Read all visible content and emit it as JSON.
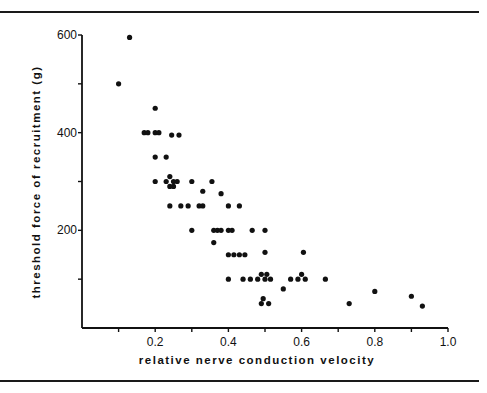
{
  "chart_data": {
    "type": "scatter",
    "title": "",
    "xlabel": "relative nerve conduction velocity",
    "ylabel": "threshold force of recruitment (g)",
    "xlim": [
      0,
      1.0
    ],
    "ylim": [
      0,
      600
    ],
    "x_ticks": [
      0.1,
      0.2,
      0.3,
      0.4,
      0.5,
      0.6,
      0.7,
      0.8,
      0.9,
      1.0
    ],
    "x_tick_labels": [
      "0.2",
      "0.4",
      "0.6",
      "0.8",
      "1.0"
    ],
    "x_labeled_tick_values": [
      0.2,
      0.4,
      0.6,
      0.8,
      1.0
    ],
    "y_ticks": [
      100,
      200,
      300,
      400,
      500,
      600
    ],
    "y_tick_labels": [
      "200",
      "400",
      "600"
    ],
    "y_labeled_tick_values": [
      200,
      400,
      600
    ],
    "grid": false,
    "legend": null,
    "points": [
      {
        "x": 0.1,
        "y": 500
      },
      {
        "x": 0.13,
        "y": 595
      },
      {
        "x": 0.2,
        "y": 450
      },
      {
        "x": 0.17,
        "y": 400
      },
      {
        "x": 0.18,
        "y": 400
      },
      {
        "x": 0.2,
        "y": 400
      },
      {
        "x": 0.21,
        "y": 400
      },
      {
        "x": 0.245,
        "y": 395
      },
      {
        "x": 0.265,
        "y": 395
      },
      {
        "x": 0.2,
        "y": 350
      },
      {
        "x": 0.23,
        "y": 350
      },
      {
        "x": 0.2,
        "y": 300
      },
      {
        "x": 0.23,
        "y": 300
      },
      {
        "x": 0.24,
        "y": 310
      },
      {
        "x": 0.25,
        "y": 300
      },
      {
        "x": 0.26,
        "y": 300
      },
      {
        "x": 0.24,
        "y": 290
      },
      {
        "x": 0.25,
        "y": 290
      },
      {
        "x": 0.3,
        "y": 300
      },
      {
        "x": 0.33,
        "y": 280
      },
      {
        "x": 0.355,
        "y": 300
      },
      {
        "x": 0.24,
        "y": 250
      },
      {
        "x": 0.27,
        "y": 250
      },
      {
        "x": 0.29,
        "y": 250
      },
      {
        "x": 0.32,
        "y": 250
      },
      {
        "x": 0.33,
        "y": 250
      },
      {
        "x": 0.38,
        "y": 275
      },
      {
        "x": 0.4,
        "y": 250
      },
      {
        "x": 0.43,
        "y": 250
      },
      {
        "x": 0.3,
        "y": 200
      },
      {
        "x": 0.36,
        "y": 200
      },
      {
        "x": 0.37,
        "y": 200
      },
      {
        "x": 0.38,
        "y": 200
      },
      {
        "x": 0.4,
        "y": 200
      },
      {
        "x": 0.41,
        "y": 200
      },
      {
        "x": 0.465,
        "y": 200
      },
      {
        "x": 0.5,
        "y": 200
      },
      {
        "x": 0.36,
        "y": 175
      },
      {
        "x": 0.4,
        "y": 150
      },
      {
        "x": 0.415,
        "y": 150
      },
      {
        "x": 0.43,
        "y": 150
      },
      {
        "x": 0.445,
        "y": 150
      },
      {
        "x": 0.5,
        "y": 155
      },
      {
        "x": 0.4,
        "y": 100
      },
      {
        "x": 0.44,
        "y": 100
      },
      {
        "x": 0.46,
        "y": 100
      },
      {
        "x": 0.48,
        "y": 100
      },
      {
        "x": 0.49,
        "y": 110
      },
      {
        "x": 0.5,
        "y": 100
      },
      {
        "x": 0.505,
        "y": 110
      },
      {
        "x": 0.515,
        "y": 100
      },
      {
        "x": 0.495,
        "y": 60
      },
      {
        "x": 0.49,
        "y": 50
      },
      {
        "x": 0.51,
        "y": 50
      },
      {
        "x": 0.55,
        "y": 80
      },
      {
        "x": 0.57,
        "y": 100
      },
      {
        "x": 0.59,
        "y": 100
      },
      {
        "x": 0.6,
        "y": 110
      },
      {
        "x": 0.61,
        "y": 100
      },
      {
        "x": 0.605,
        "y": 155
      },
      {
        "x": 0.665,
        "y": 100
      },
      {
        "x": 0.73,
        "y": 50
      },
      {
        "x": 0.8,
        "y": 75
      },
      {
        "x": 0.9,
        "y": 65
      },
      {
        "x": 0.93,
        "y": 45
      }
    ]
  }
}
